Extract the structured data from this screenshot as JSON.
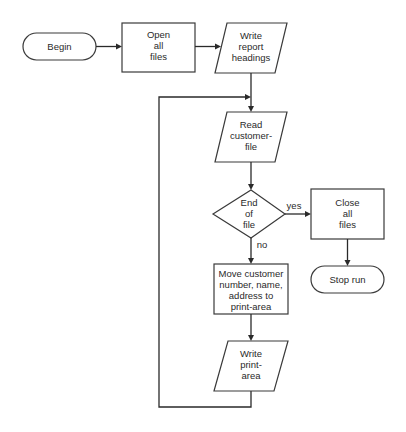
{
  "diagram": {
    "type": "flowchart",
    "nodes": [
      {
        "id": "begin",
        "shape": "terminal",
        "lines": [
          "Begin"
        ]
      },
      {
        "id": "open",
        "shape": "process",
        "lines": [
          "Open",
          "all",
          "files"
        ]
      },
      {
        "id": "headings",
        "shape": "io",
        "lines": [
          "Write",
          "report",
          "headings"
        ]
      },
      {
        "id": "read",
        "shape": "io",
        "lines": [
          "Read",
          "customer-",
          "file"
        ]
      },
      {
        "id": "eof",
        "shape": "decision",
        "lines": [
          "End",
          "of",
          "file"
        ]
      },
      {
        "id": "close",
        "shape": "process",
        "lines": [
          "Close",
          "all",
          "files"
        ]
      },
      {
        "id": "stop",
        "shape": "terminal",
        "lines": [
          "Stop run"
        ]
      },
      {
        "id": "move",
        "shape": "process",
        "lines": [
          "Move customer",
          "number, name,",
          "address to",
          "print-area"
        ]
      },
      {
        "id": "write",
        "shape": "io",
        "lines": [
          "Write",
          "print-",
          "area"
        ]
      }
    ],
    "edges": [
      {
        "from": "begin",
        "to": "open",
        "label": ""
      },
      {
        "from": "open",
        "to": "headings",
        "label": ""
      },
      {
        "from": "headings",
        "to": "read",
        "label": ""
      },
      {
        "from": "read",
        "to": "eof",
        "label": ""
      },
      {
        "from": "eof",
        "to": "close",
        "label": "yes"
      },
      {
        "from": "close",
        "to": "stop",
        "label": ""
      },
      {
        "from": "eof",
        "to": "move",
        "label": "no"
      },
      {
        "from": "move",
        "to": "write",
        "label": ""
      },
      {
        "from": "write",
        "to": "read",
        "label": "",
        "kind": "loop"
      }
    ],
    "edge_labels": {
      "yes": "yes",
      "no": "no"
    }
  }
}
